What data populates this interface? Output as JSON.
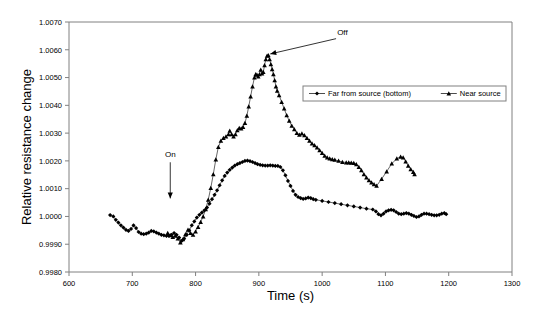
{
  "chart_data": {
    "type": "line",
    "title": "",
    "xlabel": "Time (s)",
    "ylabel": "Relative resistance change",
    "xlim": [
      600,
      1300
    ],
    "ylim": [
      0.998,
      1.007
    ],
    "xticks": [
      600,
      700,
      800,
      900,
      1000,
      1100,
      1200,
      1300
    ],
    "yticks": [
      0.998,
      0.999,
      1.0,
      1.001,
      1.002,
      1.003,
      1.004,
      1.005,
      1.006,
      1.007
    ],
    "xtick_labels": [
      "600",
      "700",
      "800",
      "900",
      "1000",
      "1100",
      "1200",
      "1300"
    ],
    "ytick_labels": [
      "0.9980",
      "0.9990",
      "1.0000",
      "1.0010",
      "1.0020",
      "1.0030",
      "1.0040",
      "1.0050",
      "1.0060",
      "1.0070"
    ],
    "grid": false,
    "legend_position": "upper right",
    "annotations": [
      {
        "name": "on-annotation",
        "text": "On",
        "label_x": 760,
        "label_y": 1.00215,
        "arrow_from_x": 760,
        "arrow_from_y": 1.00195,
        "arrow_to_x": 760,
        "arrow_to_y": 1.00065
      },
      {
        "name": "off-annotation",
        "text": "Off",
        "label_x": 1032,
        "label_y": 1.00655,
        "arrow_from_x": 1022,
        "arrow_from_y": 1.0064,
        "arrow_to_x": 918,
        "arrow_to_y": 1.00585
      }
    ],
    "series": [
      {
        "name": "Far from source (bottom)",
        "marker": "diamond",
        "color": "#000000",
        "points": [
          [
            665,
            1.00005
          ],
          [
            670,
            1.0
          ],
          [
            674,
            0.99988
          ],
          [
            678,
            0.99978
          ],
          [
            682,
            0.99968
          ],
          [
            686,
            0.9996
          ],
          [
            690,
            0.99952
          ],
          [
            694,
            0.99948
          ],
          [
            698,
            0.99955
          ],
          [
            702,
            0.99968
          ],
          [
            706,
            0.99958
          ],
          [
            710,
            0.99944
          ],
          [
            714,
            0.99938
          ],
          [
            718,
            0.99936
          ],
          [
            722,
            0.99938
          ],
          [
            726,
            0.99942
          ],
          [
            730,
            0.99948
          ],
          [
            734,
            0.99946
          ],
          [
            738,
            0.99942
          ],
          [
            742,
            0.99938
          ],
          [
            746,
            0.99934
          ],
          [
            750,
            0.99932
          ],
          [
            754,
            0.9993
          ],
          [
            758,
            0.9993
          ],
          [
            762,
            0.99934
          ],
          [
            766,
            0.9994
          ],
          [
            770,
            0.99934
          ],
          [
            774,
            0.99924
          ],
          [
            778,
            0.99912
          ],
          [
            782,
            0.9992
          ],
          [
            786,
            0.99934
          ],
          [
            790,
            0.9995
          ],
          [
            794,
            0.99968
          ],
          [
            798,
            0.99982
          ],
          [
            802,
            0.99996
          ],
          [
            806,
            1.00006
          ],
          [
            810,
            1.00014
          ],
          [
            814,
            1.00022
          ],
          [
            818,
            1.00032
          ],
          [
            822,
            1.00046
          ],
          [
            826,
            1.00062
          ],
          [
            830,
            1.00078
          ],
          [
            834,
            1.00094
          ],
          [
            838,
            1.00112
          ],
          [
            842,
            1.0013
          ],
          [
            846,
            1.00146
          ],
          [
            850,
            1.00158
          ],
          [
            854,
            1.00168
          ],
          [
            858,
            1.00176
          ],
          [
            862,
            1.00183
          ],
          [
            866,
            1.00188
          ],
          [
            870,
            1.00192
          ],
          [
            874,
            1.00196
          ],
          [
            878,
            1.002
          ],
          [
            882,
            1.00201
          ],
          [
            886,
            1.00199
          ],
          [
            890,
            1.00196
          ],
          [
            894,
            1.00192
          ],
          [
            898,
            1.00188
          ],
          [
            902,
            1.00186
          ],
          [
            906,
            1.00184
          ],
          [
            910,
            1.00183
          ],
          [
            914,
            1.00183
          ],
          [
            918,
            1.00184
          ],
          [
            922,
            1.00183
          ],
          [
            926,
            1.00182
          ],
          [
            930,
            1.00182
          ],
          [
            934,
            1.00178
          ],
          [
            938,
            1.00166
          ],
          [
            942,
            1.00148
          ],
          [
            946,
            1.00128
          ],
          [
            950,
            1.0011
          ],
          [
            954,
            1.00092
          ],
          [
            958,
            1.00078
          ],
          [
            962,
            1.0007
          ],
          [
            966,
            1.00066
          ],
          [
            970,
            1.00063
          ],
          [
            974,
            1.00065
          ],
          [
            978,
            1.00068
          ],
          [
            982,
            1.00066
          ],
          [
            986,
            1.00062
          ],
          [
            990,
            1.0006
          ],
          [
            1000,
            1.00056
          ],
          [
            1010,
            1.00052
          ],
          [
            1020,
            1.00048
          ],
          [
            1030,
            1.00044
          ],
          [
            1040,
            1.0004
          ],
          [
            1050,
            1.00036
          ],
          [
            1060,
            1.00032
          ],
          [
            1070,
            1.00028
          ],
          [
            1080,
            1.00025
          ],
          [
            1085,
            1.00018
          ],
          [
            1089,
            1.00008
          ],
          [
            1093,
            1.00004
          ],
          [
            1097,
            1.0001
          ],
          [
            1101,
            1.00018
          ],
          [
            1105,
            1.00022
          ],
          [
            1109,
            1.00024
          ],
          [
            1113,
            1.00022
          ],
          [
            1117,
            1.00016
          ],
          [
            1121,
            1.0001
          ],
          [
            1125,
            1.00008
          ],
          [
            1129,
            1.0001
          ],
          [
            1133,
            1.00012
          ],
          [
            1137,
            1.0001
          ],
          [
            1141,
            1.00006
          ],
          [
            1145,
            1.00002
          ],
          [
            1149,
            0.99998
          ],
          [
            1153,
            1.0
          ],
          [
            1157,
            1.00006
          ],
          [
            1161,
            1.0001
          ],
          [
            1165,
            1.0001
          ],
          [
            1169,
            1.00008
          ],
          [
            1173,
            1.00006
          ],
          [
            1177,
            1.00004
          ],
          [
            1181,
            1.00004
          ],
          [
            1185,
            1.00006
          ],
          [
            1189,
            1.0001
          ],
          [
            1193,
            1.00012
          ],
          [
            1196,
            1.00008
          ]
        ]
      },
      {
        "name": "Near source",
        "marker": "triangle",
        "color": "#000000",
        "points": [
          [
            756,
            0.9994
          ],
          [
            760,
            0.99932
          ],
          [
            764,
            0.99926
          ],
          [
            768,
            0.9993
          ],
          [
            772,
            0.9992
          ],
          [
            776,
            0.99906
          ],
          [
            780,
            0.99918
          ],
          [
            784,
            0.99936
          ],
          [
            788,
            0.99952
          ],
          [
            792,
            0.9994
          ],
          [
            796,
            0.99934
          ],
          [
            800,
            0.99946
          ],
          [
            804,
            0.99962
          ],
          [
            808,
            0.9998
          ],
          [
            812,
            1.0
          ],
          [
            816,
            1.00026
          ],
          [
            820,
            1.0006
          ],
          [
            824,
            1.00102
          ],
          [
            828,
            1.00152
          ],
          [
            832,
            1.00205
          ],
          [
            836,
            1.0025
          ],
          [
            840,
            1.00272
          ],
          [
            844,
            1.00282
          ],
          [
            848,
            1.00288
          ],
          [
            852,
            1.00296
          ],
          [
            854,
            1.00308
          ],
          [
            857,
            1.00296
          ],
          [
            860,
            1.00288
          ],
          [
            863,
            1.00296
          ],
          [
            866,
            1.0031
          ],
          [
            869,
            1.00318
          ],
          [
            872,
            1.00316
          ],
          [
            875,
            1.00322
          ],
          [
            878,
            1.00336
          ],
          [
            881,
            1.00362
          ],
          [
            884,
            1.00396
          ],
          [
            887,
            1.00432
          ],
          [
            890,
            1.00468
          ],
          [
            893,
            1.005
          ],
          [
            895,
            1.00512
          ],
          [
            897,
            1.0051
          ],
          [
            899,
            1.00504
          ],
          [
            901,
            1.00512
          ],
          [
            903,
            1.00528
          ],
          [
            905,
            1.00514
          ],
          [
            907,
            1.0052
          ],
          [
            909,
            1.00544
          ],
          [
            911,
            1.00566
          ],
          [
            913,
            1.00578
          ],
          [
            915,
            1.0058
          ],
          [
            917,
            1.00566
          ],
          [
            919,
            1.00548
          ],
          [
            921,
            1.0053
          ],
          [
            923,
            1.00512
          ],
          [
            925,
            1.0049
          ],
          [
            927,
            1.00468
          ],
          [
            929,
            1.00452
          ],
          [
            932,
            1.00436
          ],
          [
            936,
            1.00412
          ],
          [
            940,
            1.00388
          ],
          [
            944,
            1.00364
          ],
          [
            948,
            1.00344
          ],
          [
            952,
            1.00326
          ],
          [
            956,
            1.00314
          ],
          [
            960,
            1.003
          ],
          [
            964,
            1.00294
          ],
          [
            968,
            1.00298
          ],
          [
            972,
            1.00292
          ],
          [
            976,
            1.00282
          ],
          [
            980,
            1.00272
          ],
          [
            984,
            1.00262
          ],
          [
            988,
            1.00256
          ],
          [
            992,
            1.00248
          ],
          [
            996,
            1.00238
          ],
          [
            1000,
            1.00228
          ],
          [
            1004,
            1.00218
          ],
          [
            1008,
            1.00212
          ],
          [
            1012,
            1.00208
          ],
          [
            1016,
            1.00206
          ],
          [
            1020,
            1.00204
          ],
          [
            1026,
            1.002
          ],
          [
            1032,
            1.00196
          ],
          [
            1038,
            1.00194
          ],
          [
            1042,
            1.00194
          ],
          [
            1046,
            1.00193
          ],
          [
            1050,
            1.00192
          ],
          [
            1054,
            1.00188
          ],
          [
            1058,
            1.00178
          ],
          [
            1062,
            1.00166
          ],
          [
            1066,
            1.00152
          ],
          [
            1070,
            1.0014
          ],
          [
            1074,
            1.0013
          ],
          [
            1078,
            1.00122
          ],
          [
            1082,
            1.00116
          ],
          [
            1086,
            1.0011
          ],
          [
            1094,
            1.00135
          ],
          [
            1102,
            1.00162
          ],
          [
            1110,
            1.0019
          ],
          [
            1118,
            1.00208
          ],
          [
            1124,
            1.00215
          ],
          [
            1128,
            1.00212
          ],
          [
            1132,
            1.00198
          ],
          [
            1136,
            1.00182
          ],
          [
            1140,
            1.0017
          ],
          [
            1144,
            1.0016
          ],
          [
            1146,
            1.00152
          ]
        ]
      }
    ]
  },
  "legend": {
    "entries": [
      {
        "label": "Far from source (bottom)",
        "marker": "diamond"
      },
      {
        "label": "Near source",
        "marker": "triangle"
      }
    ]
  }
}
